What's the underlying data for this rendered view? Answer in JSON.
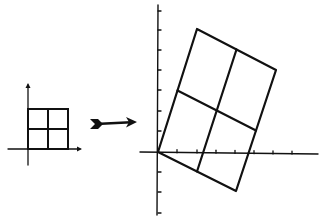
{
  "diagram": {
    "stroke_color": "#111111",
    "background": "#ffffff",
    "left_panel": {
      "origin": [
        28,
        149
      ],
      "x_axis": [
        8,
        80
      ],
      "y_axis": [
        85,
        165
      ],
      "square": {
        "x": 28,
        "y": 109,
        "size": 40
      },
      "grid_divisions": 2
    },
    "arrow": {
      "from": [
        90,
        124
      ],
      "to": [
        137,
        122
      ]
    },
    "right_panel": {
      "origin": [
        158,
        152
      ],
      "x_axis": [
        140,
        318
      ],
      "y_axis": [
        5,
        215
      ],
      "x_ticks": [
        177,
        197,
        216,
        235,
        254,
        273,
        292
      ],
      "y_ticks": [
        11,
        30,
        50,
        70,
        90,
        111,
        131,
        172,
        192,
        213
      ],
      "parallelogram": {
        "origin": [
          158,
          152
        ],
        "v_top_left": [
          197,
          29
        ],
        "v_top_right": [
          276,
          70
        ],
        "v_bottom_right": [
          236,
          191
        ]
      },
      "grid_divisions": 2
    }
  }
}
